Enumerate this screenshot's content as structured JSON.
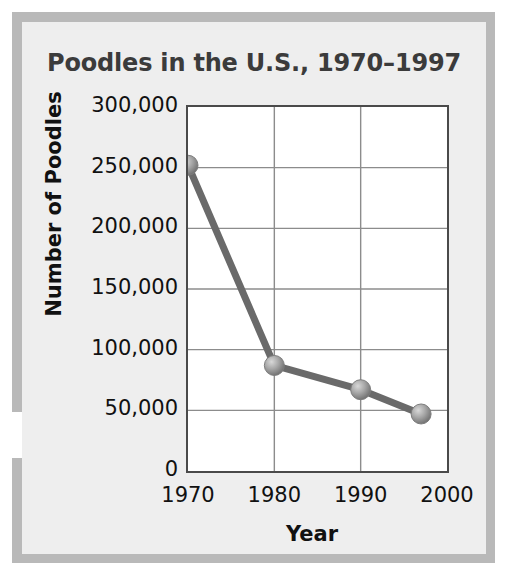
{
  "chart_data": {
    "type": "line",
    "title": "Poodles in the U.S., 1970–1997",
    "xlabel": "Year",
    "ylabel": "Number of Poodles",
    "x": [
      1970,
      1980,
      1990,
      1997
    ],
    "values": [
      252000,
      87000,
      67000,
      47000
    ],
    "series": [
      {
        "name": "Number of Poodles",
        "x": [
          1970,
          1980,
          1990,
          1997
        ],
        "values": [
          252000,
          87000,
          67000,
          47000
        ]
      }
    ],
    "xlim": [
      1970,
      2000
    ],
    "ylim": [
      0,
      300000
    ],
    "x_ticks": [
      1970,
      1980,
      1990,
      2000
    ],
    "x_tick_labels": [
      "1970",
      "1980",
      "1990",
      "2000"
    ],
    "y_ticks": [
      0,
      50000,
      100000,
      150000,
      200000,
      250000,
      300000
    ],
    "y_tick_labels": [
      "0",
      "50,000",
      "100,000",
      "150,000",
      "200,000",
      "250,000",
      "300,000"
    ],
    "grid": true,
    "legend": false,
    "legend_position": "none",
    "line_color": "#6a6a6a",
    "marker_color": "#9a9a9a",
    "marker_shape": "sphere",
    "plot_background": "#ffffff",
    "panel_background": "#eeeeee",
    "frame_color": "#b9b9b9",
    "axis_color": "#4a4a4a",
    "grid_color": "#8c8c8c",
    "title_color": "#3b3b3b",
    "label_color": "#111111"
  }
}
